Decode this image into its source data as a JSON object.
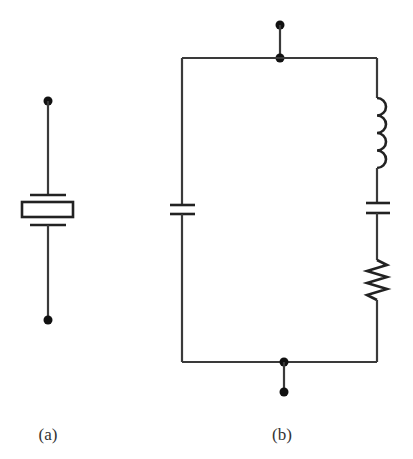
{
  "figure": {
    "colors": {
      "background": "#ffffff",
      "wire": "#3a3a3a",
      "component": "#222222",
      "terminal": "#111111",
      "label": "#333333"
    },
    "panel_a": {
      "label": "(a)",
      "description": "Quartz crystal resonator circuit symbol",
      "components": [
        "terminal-top",
        "electrode-top",
        "crystal-element",
        "electrode-bottom",
        "terminal-bottom"
      ]
    },
    "panel_b": {
      "label": "(b)",
      "description": "Crystal equivalent circuit: shunt capacitor in parallel with series inductor-capacitor-resistor branch",
      "left_branch": [
        "capacitor"
      ],
      "right_branch": [
        "inductor",
        "capacitor",
        "resistor"
      ],
      "terminals": [
        "top",
        "bottom"
      ]
    }
  }
}
